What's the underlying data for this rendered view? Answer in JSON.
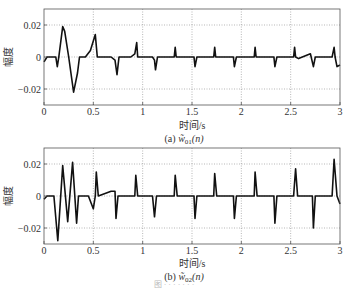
{
  "chart_data": [
    {
      "id": "a",
      "type": "line",
      "caption_prefix": "(a)",
      "caption_symbol": "w̃",
      "caption_sub": "01",
      "caption_arg": "(n)",
      "xlabel": "时间/s",
      "ylabel": "幅度",
      "xlim": [
        0,
        3
      ],
      "ylim": [
        -0.03,
        0.03
      ],
      "xticks": [
        0,
        0.5,
        1,
        1.5,
        2,
        2.5,
        3
      ],
      "xtick_labels": [
        "0",
        "0.5",
        "1",
        "1.5",
        "2",
        "2.5",
        "3"
      ],
      "yticks": [
        0.02,
        0,
        -0.02
      ],
      "ytick_labels": [
        "0.02",
        "0",
        "-0.02"
      ],
      "grid": true,
      "series": [
        {
          "name": "w01",
          "points": [
            [
              0,
              -0.003
            ],
            [
              0.03,
              0
            ],
            [
              0.12,
              0
            ],
            [
              0.135,
              -0.006
            ],
            [
              0.15,
              0
            ],
            [
              0.19,
              0.019
            ],
            [
              0.21,
              0.016
            ],
            [
              0.25,
              0
            ],
            [
              0.3,
              -0.022
            ],
            [
              0.34,
              -0.01
            ],
            [
              0.36,
              0
            ],
            [
              0.42,
              0
            ],
            [
              0.47,
              0.004
            ],
            [
              0.52,
              0.014
            ],
            [
              0.54,
              0
            ],
            [
              0.68,
              0
            ],
            [
              0.72,
              -0.002
            ],
            [
              0.74,
              -0.011
            ],
            [
              0.76,
              0
            ],
            [
              0.88,
              0
            ],
            [
              0.92,
              0.002
            ],
            [
              0.94,
              0.009
            ],
            [
              0.95,
              0
            ],
            [
              1.1,
              0
            ],
            [
              1.12,
              -0.002
            ],
            [
              1.13,
              -0.008
            ],
            [
              1.15,
              0
            ],
            [
              1.32,
              0
            ],
            [
              1.33,
              0.006
            ],
            [
              1.34,
              0
            ],
            [
              1.52,
              0
            ],
            [
              1.53,
              -0.006
            ],
            [
              1.55,
              0
            ],
            [
              1.72,
              0
            ],
            [
              1.73,
              0.006
            ],
            [
              1.74,
              0
            ],
            [
              1.92,
              0
            ],
            [
              1.93,
              -0.006
            ],
            [
              1.95,
              0
            ],
            [
              2.13,
              0
            ],
            [
              2.14,
              0.006
            ],
            [
              2.15,
              0
            ],
            [
              2.33,
              0
            ],
            [
              2.34,
              -0.006
            ],
            [
              2.36,
              0
            ],
            [
              2.53,
              0
            ],
            [
              2.54,
              0.006
            ],
            [
              2.55,
              0
            ],
            [
              2.58,
              -0.001
            ],
            [
              2.7,
              0.002
            ],
            [
              2.73,
              -0.006
            ],
            [
              2.75,
              0
            ],
            [
              2.92,
              0
            ],
            [
              2.94,
              0.006
            ],
            [
              2.95,
              0
            ],
            [
              2.97,
              -0.006
            ],
            [
              3.0,
              -0.005
            ]
          ]
        }
      ]
    },
    {
      "id": "b",
      "type": "line",
      "caption_prefix": "(b)",
      "caption_symbol": "w̃",
      "caption_sub": "02",
      "caption_arg": "(n)",
      "xlabel": "时间/s",
      "ylabel": "幅度",
      "xlim": [
        0,
        3
      ],
      "ylim": [
        -0.03,
        0.03
      ],
      "xticks": [
        0,
        0.5,
        1,
        1.5,
        2,
        2.5,
        3
      ],
      "xtick_labels": [
        "0",
        "0.5",
        "1",
        "1.5",
        "2",
        "2.5",
        "3"
      ],
      "yticks": [
        0.02,
        0,
        -0.02
      ],
      "ytick_labels": [
        "0.02",
        "0",
        "-0.02"
      ],
      "grid": true,
      "series": [
        {
          "name": "w02",
          "points": [
            [
              0,
              -0.002
            ],
            [
              0.03,
              0
            ],
            [
              0.1,
              0
            ],
            [
              0.14,
              -0.028
            ],
            [
              0.19,
              0.019
            ],
            [
              0.24,
              -0.016
            ],
            [
              0.29,
              0.021
            ],
            [
              0.33,
              -0.017
            ],
            [
              0.35,
              0
            ],
            [
              0.45,
              0
            ],
            [
              0.5,
              -0.008
            ],
            [
              0.52,
              0
            ],
            [
              0.53,
              0.015
            ],
            [
              0.55,
              0
            ],
            [
              0.68,
              0.003
            ],
            [
              0.72,
              0.003
            ],
            [
              0.73,
              -0.014
            ],
            [
              0.75,
              0
            ],
            [
              0.92,
              0
            ],
            [
              0.93,
              0.013
            ],
            [
              0.95,
              0
            ],
            [
              1.1,
              0
            ],
            [
              1.12,
              -0.013
            ],
            [
              1.14,
              0
            ],
            [
              1.32,
              0
            ],
            [
              1.33,
              0.013
            ],
            [
              1.35,
              0
            ],
            [
              1.52,
              0
            ],
            [
              1.53,
              -0.014
            ],
            [
              1.55,
              0
            ],
            [
              1.72,
              0
            ],
            [
              1.73,
              0.014
            ],
            [
              1.75,
              0
            ],
            [
              1.92,
              0
            ],
            [
              1.93,
              -0.014
            ],
            [
              1.95,
              0
            ],
            [
              2.13,
              0
            ],
            [
              2.14,
              0.015
            ],
            [
              2.16,
              0
            ],
            [
              2.33,
              0
            ],
            [
              2.34,
              -0.017
            ],
            [
              2.36,
              0
            ],
            [
              2.53,
              0
            ],
            [
              2.55,
              0.017
            ],
            [
              2.57,
              0
            ],
            [
              2.72,
              0
            ],
            [
              2.73,
              -0.02
            ],
            [
              2.75,
              0
            ],
            [
              2.92,
              0
            ],
            [
              2.94,
              0.023
            ],
            [
              2.97,
              0
            ],
            [
              3.0,
              -0.005
            ]
          ]
        }
      ]
    }
  ],
  "figure_caption": "图 · · · · · · ·"
}
